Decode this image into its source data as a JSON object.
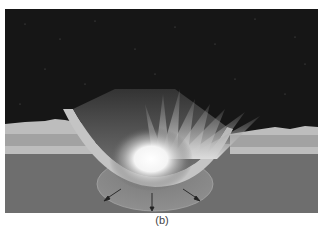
{
  "figure": {
    "label": "(b)",
    "colors": {
      "sky": "#161616",
      "surface_top": "#bdbdbd",
      "surface_band": "#9c9c9c",
      "ground": "#6e6e6e",
      "flash": "#ffffff"
    },
    "arrows": 3
  }
}
